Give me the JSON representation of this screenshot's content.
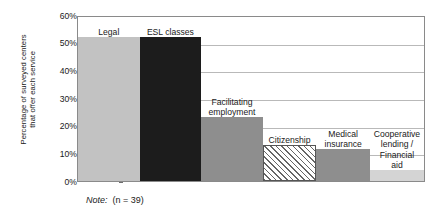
{
  "chart_data": {
    "type": "bar",
    "title": "",
    "subtitle": "",
    "xlabel": "",
    "ylabel": "Percentage of surveyed centers\nthat offer each service",
    "ylim": [
      0,
      60
    ],
    "ytick_labels": [
      "60%",
      "50%",
      "40%",
      "30%",
      "20%",
      "10%",
      "0%"
    ],
    "ytick_values": [
      60,
      50,
      40,
      30,
      20,
      10,
      0
    ],
    "grid": true,
    "grid_axis": "y",
    "legend": "none",
    "categories": [
      "Legal",
      "ESL classes",
      "Facilitating\nemployment",
      "Citizenship",
      "Medical\ninsurance",
      "Cooperative\nlending /\nFinancial\naid"
    ],
    "values": [
      52,
      52,
      23,
      13,
      11.5,
      4
    ],
    "bars": [
      {
        "label": "Legal",
        "value": 52,
        "fill": "solid-light-gray",
        "color": "#c2c2c2",
        "width_share": 17.8
      },
      {
        "label": "ESL classes",
        "value": 52,
        "fill": "solid-near-black",
        "color": "#1c1c1c",
        "width_share": 17.8
      },
      {
        "label": "Facilitating\nemployment",
        "value": 23,
        "fill": "solid-mid-gray",
        "color": "#8e8e8e",
        "width_share": 17.8
      },
      {
        "label": "Citizenship",
        "value": 13,
        "fill": "diagonal-hatch",
        "color": "#ffffff",
        "width_share": 15.5
      },
      {
        "label": "Medical\ninsurance",
        "value": 11.5,
        "fill": "solid-mid-gray",
        "color": "#8e8e8e",
        "width_share": 15.5
      },
      {
        "label": "Cooperative\nlending /\nFinancial\naid",
        "value": 4,
        "fill": "solid-very-light",
        "color": "#d4d4d4",
        "width_share": 15.6
      }
    ],
    "note_prefix": "Note:",
    "note_value": "(n = 39)"
  },
  "axis": {
    "y_title": "Percentage of surveyed centers\nthat offer each service",
    "ticks": [
      "60%",
      "50%",
      "40%",
      "30%",
      "20%",
      "10%",
      "0%"
    ]
  },
  "note": {
    "prefix": "Note:",
    "value": "(n = 39)"
  },
  "colors": {
    "plot_border": "#8a8a8a",
    "gridline": "#b9b9b9",
    "text": "#1a1a1a",
    "bar_light_gray": "#c2c2c2",
    "bar_near_black": "#1c1c1c",
    "bar_mid_gray": "#8e8e8e",
    "bar_very_light": "#d4d4d4",
    "hatch_line": "#666666"
  }
}
